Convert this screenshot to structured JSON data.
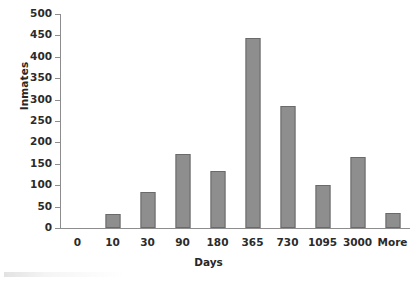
{
  "chart_data": {
    "type": "bar",
    "title": "",
    "xlabel": "Days",
    "ylabel": "Inmates",
    "categories": [
      "0",
      "10",
      "30",
      "90",
      "180",
      "365",
      "730",
      "1095",
      "3000",
      "More"
    ],
    "values": [
      0,
      33,
      85,
      172,
      133,
      443,
      285,
      100,
      167,
      35
    ],
    "series": [
      {
        "name": "Inmates",
        "values": [
          0,
          33,
          85,
          172,
          133,
          443,
          285,
          100,
          167,
          35
        ]
      }
    ],
    "ylim": [
      0,
      500
    ],
    "ytick_step": 50,
    "yticks": [
      0,
      50,
      100,
      150,
      200,
      250,
      300,
      350,
      400,
      450,
      500
    ],
    "ytick_labels": [
      "0",
      "50",
      "100",
      "150",
      "200",
      "250",
      "300",
      "350",
      "400",
      "450",
      "500"
    ],
    "grid": false,
    "legend": false,
    "legend_position": "none",
    "bar_color": "#8e8e8e",
    "bar_border_color": "#6a6a6a",
    "axis_color": "#8d8d8d",
    "text_color": "#2b2b2b",
    "background_color": "#ffffff"
  }
}
